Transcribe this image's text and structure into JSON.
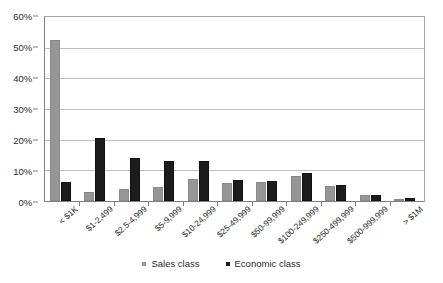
{
  "chart_data": {
    "type": "bar",
    "title": "",
    "xlabel": "",
    "ylabel": "",
    "ylim": [
      0,
      60
    ],
    "ytick_labels": [
      "0%",
      "10%",
      "20%",
      "30%",
      "40%",
      "50%",
      "60%"
    ],
    "ytick_values": [
      0,
      10,
      20,
      30,
      40,
      50,
      60
    ],
    "grid": true,
    "legend_position": "bottom",
    "categories": [
      "< $1K",
      "$1-2,499",
      "$2.5-4,999",
      "$5-9,999",
      "$10-24,999",
      "$25-49,999",
      "$50-99,999",
      "$100-249,999",
      "$250-499,999",
      "$500-999,999",
      "> $1M"
    ],
    "series": [
      {
        "name": "Sales class",
        "color": "#969696",
        "values": [
          52.5,
          3.0,
          4.0,
          4.7,
          7.3,
          6.0,
          6.3,
          8.2,
          5.0,
          2.0,
          0.7
        ]
      },
      {
        "name": "Economic class",
        "color": "#1c1c1c",
        "values": [
          6.3,
          20.7,
          14.0,
          13.0,
          13.0,
          6.8,
          6.5,
          9.0,
          5.2,
          2.0,
          1.0
        ]
      }
    ]
  },
  "legend": {
    "items": [
      {
        "label": "Sales class"
      },
      {
        "label": "Economic class"
      }
    ]
  }
}
